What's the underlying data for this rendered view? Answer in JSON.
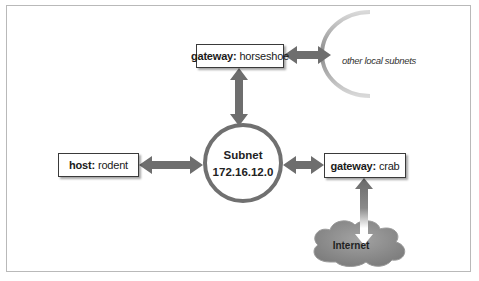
{
  "diagram": {
    "subnet": {
      "label": "Subnet",
      "address": "172.16.12.0"
    },
    "nodes": [
      {
        "id": "gateway-horseshoe",
        "role": "gateway:",
        "name": "horseshoe"
      },
      {
        "id": "host-rodent",
        "role": "host:",
        "name": "rodent"
      },
      {
        "id": "gateway-crab",
        "role": "gateway:",
        "name": "crab"
      }
    ],
    "external": {
      "other_subnets_label": "other local subnets",
      "internet_label": "Internet"
    },
    "colors": {
      "arrow": "#6e6e6e",
      "circle_stroke": "#707070",
      "cloud_fill": "#8f8f8f",
      "box_border": "#3a3a3a",
      "frame": "#b9b9b9"
    }
  }
}
